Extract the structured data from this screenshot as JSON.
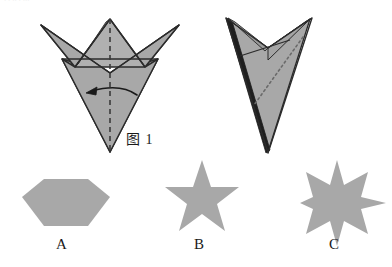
{
  "page": {
    "width": 392,
    "height": 267,
    "background": "#ffffff",
    "kind": "origami-fold-multiple-choice-figure"
  },
  "colors": {
    "paper_fill": "#a8a8a8",
    "paper_fill_light": "#b0b0b0",
    "paper_fill_dark": "#9a9a9a",
    "outline": "#2b2b2b",
    "outline_thick": "#1a1a1a",
    "fold_line": "#3a3a3a",
    "shape_fill": "#a8a8a8",
    "text": "#1a1a1a"
  },
  "figure1": {
    "caption": "图 1",
    "description": "Folded paper shape with vertical dashed fold line and curved arrow indicating fold direction to the left",
    "fold_line": {
      "name": "vertical-dashed-fold-line",
      "style": "dashed",
      "x": 110,
      "y_top": 19,
      "y_bottom": 152
    },
    "arrow": {
      "name": "fold-direction-arrow",
      "direction": "right-to-left",
      "curve": "arc"
    },
    "outline_points": "110,19 95,33 41,25 75,66 62,59 110,152 158,59 145,66 179,25 125,33",
    "vertices": {
      "top_apex": [
        110,
        19
      ],
      "left_wing_tip": [
        41,
        25
      ],
      "right_wing_tip": [
        179,
        25
      ],
      "bottom_tip": [
        110,
        152
      ]
    }
  },
  "figure2": {
    "description": "Result of the fold: narrow V-shaped arrowhead form with dotted diagonal crease",
    "crease": {
      "name": "diagonal-dotted-crease",
      "style": "dotted"
    },
    "vertices": {
      "left_tip": [
        226,
        18
      ],
      "right_tip": [
        312,
        18
      ],
      "notch": [
        268,
        48
      ],
      "bottom_tip": [
        268,
        152
      ]
    }
  },
  "options": [
    {
      "key": "A",
      "label": "A",
      "shape": "hexagon",
      "sides": 6,
      "center": [
        66,
        197
      ],
      "radius": 33
    },
    {
      "key": "B",
      "label": "B",
      "shape": "five-pointed-star",
      "points": 5,
      "center": [
        202,
        197
      ],
      "outer_radius": 37,
      "inner_radius": 15
    },
    {
      "key": "C",
      "label": "C",
      "shape": "six-pointed-star",
      "points": 6,
      "center": [
        337,
        197
      ],
      "outer_radius": 37,
      "inner_radius": 14
    }
  ],
  "top_artifact": {
    "text": "·  ·   ··   ·   ···"
  }
}
